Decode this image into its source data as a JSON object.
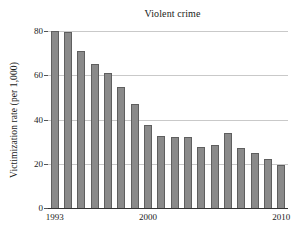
{
  "chart_data": {
    "type": "bar",
    "title": "Violent crime",
    "xlabel": "",
    "ylabel": "Victimization rate (per 1,000)",
    "categories": [
      "1993",
      "1994",
      "1995",
      "1996",
      "1997",
      "1998",
      "1999",
      "2000",
      "2001",
      "2002",
      "2003",
      "2004",
      "2005",
      "2006",
      "2007",
      "2008",
      "2009",
      "2010"
    ],
    "values": [
      80,
      79.5,
      71,
      65,
      61,
      54.5,
      47,
      37.5,
      32.5,
      32,
      32,
      27.5,
      28.5,
      34,
      27,
      25,
      22,
      19.5
    ],
    "ylim": [
      0,
      80
    ],
    "yticks": [
      0,
      20,
      40,
      60,
      80
    ],
    "ytick_labels": [
      "0",
      "20",
      "40",
      "60",
      "80"
    ],
    "xtick_labels": [
      "1993",
      "2000",
      "2010"
    ],
    "xtick_categories": [
      "1993",
      "2000",
      "2010"
    ],
    "grid": true,
    "legend": "none",
    "bar_color": "#8a8a8a",
    "bar_edge_color": "#5f5f5f",
    "grid_color": "#c9c9c9",
    "axis_color": "#333333"
  }
}
